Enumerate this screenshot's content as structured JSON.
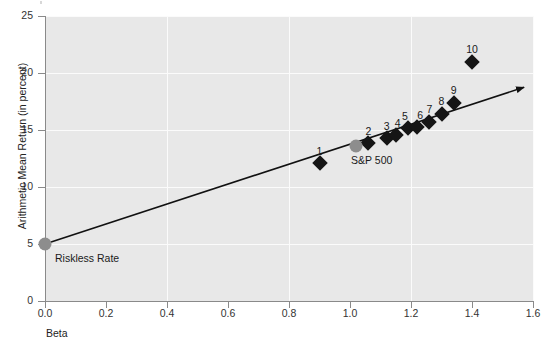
{
  "chart_data": {
    "type": "scatter",
    "title": "",
    "xlabel": "Beta",
    "ylabel": "Arithmetic Mean Return (in percent)",
    "xlim": [
      0.0,
      1.6
    ],
    "ylim": [
      0,
      25
    ],
    "xticks": [
      "0.0",
      "0.2",
      "0.4",
      "0.6",
      "0.8",
      "1.0",
      "1.2",
      "1.4",
      "1.6"
    ],
    "xtick_values": [
      0.0,
      0.2,
      0.4,
      0.6,
      0.8,
      1.0,
      1.2,
      1.4,
      1.6
    ],
    "yticks": [
      "0",
      "5",
      "10",
      "15",
      "20",
      "25"
    ],
    "ytick_values": [
      0,
      5,
      10,
      15,
      20,
      25
    ],
    "grid": true,
    "legend": "none",
    "series": [
      {
        "name": "Portfolios",
        "marker": "diamond",
        "color": "#151515",
        "points": [
          {
            "label": "1",
            "x": 0.9,
            "y": 12.1,
            "label_dx": 0,
            "label_dy": -17
          },
          {
            "label": "2",
            "x": 1.06,
            "y": 13.9,
            "label_dx": 0,
            "label_dy": -17
          },
          {
            "label": "3",
            "x": 1.12,
            "y": 14.3,
            "label_dx": 0,
            "label_dy": -17
          },
          {
            "label": "4",
            "x": 1.15,
            "y": 14.6,
            "label_dx": 2,
            "label_dy": -17
          },
          {
            "label": "5",
            "x": 1.19,
            "y": 15.2,
            "label_dx": -3,
            "label_dy": -17
          },
          {
            "label": "6",
            "x": 1.22,
            "y": 15.3,
            "label_dx": 3,
            "label_dy": -17
          },
          {
            "label": "7",
            "x": 1.26,
            "y": 15.7,
            "label_dx": 0,
            "label_dy": -18
          },
          {
            "label": "8",
            "x": 1.3,
            "y": 16.4,
            "label_dx": 0,
            "label_dy": -18
          },
          {
            "label": "9",
            "x": 1.34,
            "y": 17.4,
            "label_dx": 0,
            "label_dy": -18
          },
          {
            "label": "10",
            "x": 1.4,
            "y": 21.0,
            "label_dx": 0,
            "label_dy": -18
          }
        ]
      },
      {
        "name": "Benchmarks",
        "marker": "circle",
        "color": "#8d8d8d",
        "points": [
          {
            "label": "Riskless Rate",
            "x": 0.0,
            "y": 5.0,
            "label_dx": 10,
            "label_dy": 9
          },
          {
            "label": "S&P 500",
            "x": 1.02,
            "y": 13.6,
            "label_dx": -5,
            "label_dy": 9
          }
        ]
      }
    ],
    "trendline": {
      "name": "Security Market Line",
      "x0": 0.0,
      "y0": 5.0,
      "x1": 1.6,
      "y1": 18.5,
      "arrow_end": true,
      "color": "#111111"
    },
    "annotations": [
      "Riskless Rate",
      "S&P 500"
    ]
  }
}
